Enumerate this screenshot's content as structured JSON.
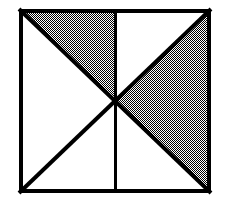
{
  "figure": {
    "canvas": {
      "width": 229,
      "height": 208,
      "background": "#ffffff"
    },
    "square": {
      "name": "outer-square",
      "left": 19,
      "top": 9,
      "right": 211,
      "bottom": 193,
      "width": 192,
      "height": 184,
      "stroke_color": "#000000",
      "stroke_width": 4,
      "fill": "#ffffff"
    },
    "center_point": {
      "x": 115,
      "y": 101
    },
    "lines": [
      {
        "name": "diagonal-top-left-to-bottom-right",
        "x1": 19,
        "y1": 9,
        "x2": 211,
        "y2": 193,
        "stroke_color": "#000000",
        "stroke_width": 4
      },
      {
        "name": "diagonal-top-right-to-bottom-left",
        "x1": 211,
        "y1": 9,
        "x2": 19,
        "y2": 193,
        "stroke_color": "#000000",
        "stroke_width": 4
      },
      {
        "name": "vertical-median",
        "x1": 115,
        "y1": 9,
        "x2": 115,
        "y2": 193,
        "stroke_color": "#000000",
        "stroke_width": 3
      }
    ],
    "shaded_regions": [
      {
        "name": "shaded-triangle-top-left-quadrant",
        "points": "19,9 115,9 115,101",
        "fill_pattern": "checkerboard-50-percent",
        "fill_color": "#808080"
      },
      {
        "name": "shaded-triangle-right-wedge",
        "points": "211,9 211,193 115,101",
        "fill_pattern": "checkerboard-50-percent",
        "fill_color": "#808080"
      }
    ],
    "unshaded_regions": [
      {
        "name": "white-triangle-left-wedge",
        "points": "19,9 19,193 115,101"
      },
      {
        "name": "white-triangle-top-right-quadrant",
        "points": "115,9 211,9 115,101"
      },
      {
        "name": "white-triangle-bottom-left-quadrant",
        "points": "19,193 115,193 115,101"
      },
      {
        "name": "white-triangle-bottom-right-quadrant",
        "points": "115,193 211,193 115,101"
      }
    ],
    "pattern": {
      "name": "checkerboard-dither",
      "cell_size": 1,
      "dark": "#000000",
      "light": "#ffffff",
      "effective_gray": "#8c8c8c"
    }
  }
}
